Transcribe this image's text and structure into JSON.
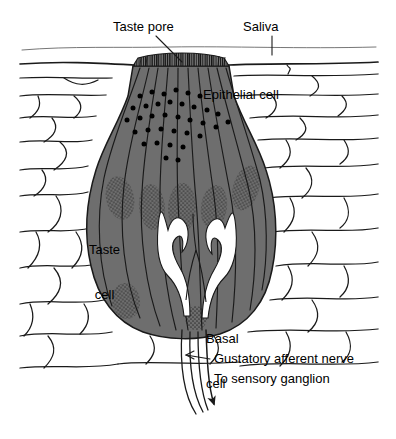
{
  "figure": {
    "type": "labeled-biological-diagram"
  },
  "labels": {
    "taste_pore": "Taste pore",
    "saliva": "Saliva",
    "epithelial_cell": "Epithelial cell",
    "taste_cell_line1": "Taste",
    "taste_cell_line2": "cell",
    "basal_cell_line1": "Basal",
    "basal_cell_line2": "cell",
    "gustatory_nerve": "Gustatory afferent nerve",
    "sensory_ganglion": "To sensory ganglion"
  },
  "colors": {
    "line": "#1a1a1a",
    "taste_bud_fill": "#6e6e6e",
    "nucleus_stipple": "#3c3c3c",
    "granule": "#000000",
    "nerve_channel": "#ffffff",
    "pore_plug": "#4a4a4a",
    "background": "#ffffff"
  },
  "structures": {
    "saliva_surface": "faint wavy line across the top of the epithelium",
    "epithelial_surface": "bold wavy line forming the tongue surface",
    "taste_pore": "narrow opening at the epithelial surface filled with microvilli",
    "taste_bud": "large gray flask/onion-shaped body embedded in the epithelium",
    "taste_cells": "elongated spindle cells fanning from the pore to the base",
    "nuclei": "stippled oval nuclei inside the taste cells",
    "granules": "black secretory granules clustered near the taste pore and nerve tips",
    "nerve_fibers": "white channels branching upward inside the taste bud",
    "basal_cell": "small stippled cell at the base of the taste bud",
    "afferent_bundle": "four nerve fibers leaving the base, converging into an arrow"
  }
}
